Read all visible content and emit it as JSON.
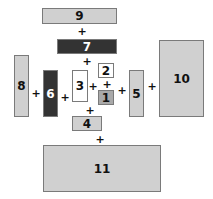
{
  "diagram": {
    "title": "",
    "boxes": [
      {
        "id": "1",
        "label": "1",
        "x": 98,
        "y": 90,
        "w": 16,
        "h": 15,
        "fill": "#a9a9a9",
        "text": "#111111"
      },
      {
        "id": "2",
        "label": "2",
        "x": 98,
        "y": 63,
        "w": 16,
        "h": 15,
        "fill": "#ffffff",
        "text": "#111111"
      },
      {
        "id": "3",
        "label": "3",
        "x": 72,
        "y": 70,
        "w": 16,
        "h": 32,
        "fill": "#ffffff",
        "text": "#111111"
      },
      {
        "id": "4",
        "label": "4",
        "x": 72,
        "y": 116,
        "w": 30,
        "h": 15,
        "fill": "#d0d0d0",
        "text": "#111111"
      },
      {
        "id": "5",
        "label": "5",
        "x": 129,
        "y": 70,
        "w": 15,
        "h": 47,
        "fill": "#d0d0d0",
        "text": "#111111"
      },
      {
        "id": "6",
        "label": "6",
        "x": 43,
        "y": 70,
        "w": 15,
        "h": 47,
        "fill": "#333333",
        "text": "#ffffff"
      },
      {
        "id": "7",
        "label": "7",
        "x": 57,
        "y": 39,
        "w": 60,
        "h": 15,
        "fill": "#333333",
        "text": "#ffffff"
      },
      {
        "id": "8",
        "label": "8",
        "x": 14,
        "y": 55,
        "w": 15,
        "h": 62,
        "fill": "#d0d0d0",
        "text": "#111111"
      },
      {
        "id": "9",
        "label": "9",
        "x": 42,
        "y": 8,
        "w": 75,
        "h": 16,
        "fill": "#d0d0d0",
        "text": "#111111"
      },
      {
        "id": "10",
        "label": "10",
        "x": 159,
        "y": 40,
        "w": 45,
        "h": 77,
        "fill": "#d0d0d0",
        "text": "#111111"
      },
      {
        "id": "11",
        "label": "11",
        "x": 43,
        "y": 145,
        "w": 118,
        "h": 47,
        "fill": "#d0d0d0",
        "text": "#111111"
      }
    ],
    "plus_signs": [
      {
        "id": "p-9-7",
        "label": "+",
        "x": 82,
        "y": 31
      },
      {
        "id": "p-7-3",
        "label": "+",
        "x": 87,
        "y": 61
      },
      {
        "id": "p-8-6",
        "label": "+",
        "x": 36,
        "y": 93
      },
      {
        "id": "p-6-3",
        "label": "+",
        "x": 65,
        "y": 97
      },
      {
        "id": "p-3-1",
        "label": "+",
        "x": 93,
        "y": 86
      },
      {
        "id": "p-2-1",
        "label": "+",
        "x": 107,
        "y": 84
      },
      {
        "id": "p-1-5",
        "label": "+",
        "x": 122,
        "y": 90
      },
      {
        "id": "p-5-10",
        "label": "+",
        "x": 152,
        "y": 86
      },
      {
        "id": "p-3-4",
        "label": "+",
        "x": 90,
        "y": 110
      },
      {
        "id": "p-4-11",
        "label": "+",
        "x": 100,
        "y": 139
      }
    ]
  }
}
